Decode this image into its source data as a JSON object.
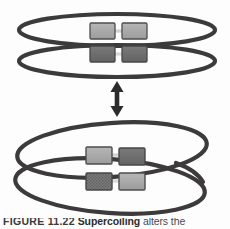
{
  "figure": {
    "background_color": "#fdfdfd",
    "ring_stroke_color": "#3c3a3a",
    "ring_stroke_width": 4.2,
    "arrow_color": "#2b2b2b",
    "box_light_fill": "#a8a8a8",
    "box_dark_fill": "#6e6e6e",
    "box_hatched_fill": "#7a7a7a",
    "box_border_color": "#4a4a4a",
    "linker_color": "#cfcfcf",
    "top_panel": {
      "label": "separate-circular-dna-molecules",
      "rings": [
        {
          "name": "top-ring-upper",
          "cx": 117,
          "cy": 30,
          "rx": 98,
          "ry": 16,
          "boxes": [
            {
              "name": "box-upper-left",
              "shade": "light",
              "x": 90,
              "y": 23,
              "w": 25,
              "h": 16
            },
            {
              "name": "box-upper-right",
              "shade": "light",
              "x": 122,
              "y": 23,
              "w": 25,
              "h": 16
            }
          ]
        },
        {
          "name": "top-ring-lower",
          "cx": 117,
          "cy": 60,
          "rx": 98,
          "ry": 16,
          "boxes": [
            {
              "name": "box-lower-left",
              "shade": "dark",
              "x": 90,
              "y": 46,
              "w": 25,
              "h": 16
            },
            {
              "name": "box-lower-right",
              "shade": "dark",
              "x": 122,
              "y": 46,
              "w": 25,
              "h": 16
            }
          ]
        }
      ]
    },
    "arrow": {
      "name": "double-headed-vertical-arrow",
      "x": 117,
      "y_top": 82,
      "y_bottom": 116,
      "head_width": 13,
      "shaft_width": 4.5
    },
    "bottom_panel": {
      "label": "catenated-interlocked-dna-circles",
      "rings": [
        {
          "name": "bottom-ring-upper",
          "cx": 112,
          "cy": 150,
          "rx": 96,
          "ry": 27,
          "rotate": -5,
          "boxes": [
            {
              "name": "box-catenated-upper-left",
              "shade": "light",
              "x": 86,
              "y": 147,
              "w": 26,
              "h": 17
            },
            {
              "name": "box-catenated-upper-right",
              "shade": "dark",
              "x": 119,
              "y": 148,
              "w": 26,
              "h": 17
            }
          ]
        },
        {
          "name": "bottom-ring-lower",
          "cx": 112,
          "cy": 187,
          "rx": 96,
          "ry": 27,
          "rotate": 5,
          "boxes": [
            {
              "name": "box-catenated-lower-left",
              "shade": "hatched",
              "x": 86,
              "y": 173,
              "w": 26,
              "h": 17
            },
            {
              "name": "box-catenated-lower-right",
              "shade": "light",
              "x": 119,
              "y": 173,
              "w": 26,
              "h": 17
            }
          ]
        }
      ]
    }
  },
  "caption": {
    "number_label": "FIGURE 11.22",
    "lead_text": "Supercoiling",
    "body_text": " alters",
    "trailing_text": "the"
  }
}
